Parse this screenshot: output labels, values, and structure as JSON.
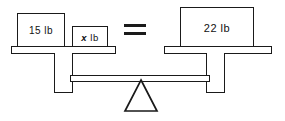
{
  "diagram": {
    "type": "balance-scale",
    "equation": "15 lb + x lb = 22 lb",
    "unit": "lb",
    "line_color": "#1a1a1a",
    "fill_color": "#ffffff",
    "text_color": "#111111"
  },
  "left_pan": {
    "weights": [
      {
        "label": "15 lb",
        "value": "15",
        "unit": "lb",
        "kind": "known"
      },
      {
        "label_prefix": "x",
        "label_suffix": " lb",
        "value": "x",
        "unit": "lb",
        "kind": "unknown"
      }
    ]
  },
  "relation": {
    "symbol": "=",
    "name": "equals-sign"
  },
  "right_pan": {
    "weights": [
      {
        "label": "22 lb",
        "value": "22",
        "unit": "lb",
        "kind": "known"
      }
    ]
  },
  "structure": {
    "fulcrum_shape": "triangle",
    "left_post": "left-support-post",
    "right_post": "right-support-post",
    "beam": "horizontal-balance-beam"
  }
}
